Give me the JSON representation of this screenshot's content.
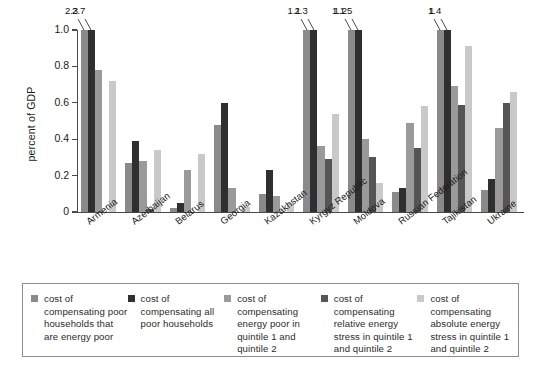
{
  "chart_data": {
    "type": "bar",
    "title": "",
    "xlabel": "",
    "ylabel": "percent of GDP",
    "ylim": [
      0,
      1.0
    ],
    "yticks": [
      "0",
      "0.2",
      "0.4",
      "0.6",
      "0.8",
      "1.0"
    ],
    "ytick_values": [
      0,
      0.2,
      0.4,
      0.6,
      0.8,
      1.0
    ],
    "grid": false,
    "legend_position": "bottom",
    "note": "Bars exceeding the 1.0 axis maximum are clipped and annotated with their true value.",
    "categories": [
      "Armenia",
      "Azerbaijan",
      "Belarus",
      "Georgia",
      "Kazakhstan",
      "Kyrgyz Republic",
      "Moldova",
      "Russian Federation",
      "Tajikistan",
      "Ukraine"
    ],
    "series": [
      {
        "name": "cost of compensating poor households that are energy poor",
        "color": "#8a8a8a",
        "values": [
          2.3,
          0.27,
          0.02,
          0.48,
          0.1,
          1.1,
          1.1,
          0.11,
          1.0,
          0.12
        ]
      },
      {
        "name": "cost of compensating all poor households",
        "color": "#2f2f2f",
        "values": [
          2.7,
          0.39,
          0.05,
          0.6,
          0.23,
          2.3,
          1.25,
          0.13,
          1.4,
          0.18
        ]
      },
      {
        "name": "cost of compensating energy poor in quintile 1 and quintile 2",
        "color": "#9a9a9a",
        "values": [
          0.78,
          0.28,
          0.23,
          0.13,
          0.09,
          0.36,
          0.4,
          0.49,
          0.69,
          0.46
        ]
      },
      {
        "name": "cost of compensating relative energy stress in quintile 1 and quintile 2",
        "color": "#555555",
        "values": [
          0.0,
          0.015,
          0.0,
          0.0,
          0.0,
          0.29,
          0.3,
          0.35,
          0.59,
          0.6
        ]
      },
      {
        "name": "cost of compensating absolute energy stress in quintile 1 and quintile 2",
        "color": "#c9c9c9",
        "values": [
          0.72,
          0.34,
          0.32,
          0.03,
          0.05,
          0.54,
          0.16,
          0.58,
          0.91,
          0.66
        ]
      }
    ],
    "clipped_annotations": [
      {
        "category": "Armenia",
        "series_index": 0,
        "label": "2.3"
      },
      {
        "category": "Armenia",
        "series_index": 1,
        "label": "2.7"
      },
      {
        "category": "Kyrgyz Republic",
        "series_index": 0,
        "label": "1.1"
      },
      {
        "category": "Kyrgyz Republic",
        "series_index": 1,
        "label": "2.3"
      },
      {
        "category": "Moldova",
        "series_index": 0,
        "label": "1.1"
      },
      {
        "category": "Moldova",
        "series_index": 1,
        "label": "1.25"
      },
      {
        "category": "Tajikistan",
        "series_index": 0,
        "label": "1"
      },
      {
        "category": "Tajikistan",
        "series_index": 1,
        "label": "1.4"
      }
    ]
  },
  "legend": {
    "items": [
      {
        "swatch": "#8a8a8a",
        "label": "cost of compensating poor households that are energy poor"
      },
      {
        "swatch": "#2f2f2f",
        "label": "cost of compensating all poor households"
      },
      {
        "swatch": "#9a9a9a",
        "label": "cost of compensating energy poor in quintile 1 and quintile 2"
      },
      {
        "swatch": "#555555",
        "label": "cost of compensating relative energy stress in quintile 1 and quintile 2"
      },
      {
        "swatch": "#c9c9c9",
        "label": "cost of compensating absolute energy stress in quintile 1 and quintile 2"
      }
    ]
  }
}
